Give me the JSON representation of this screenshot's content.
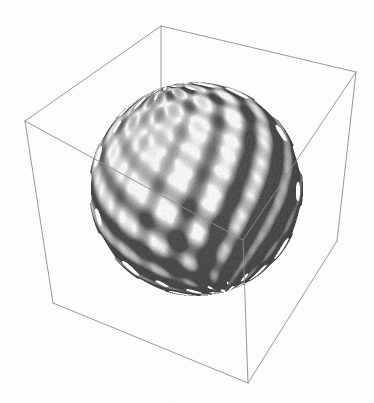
{
  "figure": {
    "kind": "3d-surface-plot",
    "background_color": "#fdfdfc",
    "width": 374,
    "height": 403
  },
  "bounding_box": {
    "name": "wireframe-cube",
    "line_color": "#8d8d8d",
    "hidden_line_color": "#a9a9a9",
    "line_width": 0.9,
    "vertices": {
      "back_top_left": [
        25,
        121
      ],
      "back_top_center": [
        161,
        26
      ],
      "back_top_right": [
        356,
        72
      ],
      "front_top_left": [
        92,
        168
      ],
      "left_bottom": [
        53,
        303
      ],
      "center_top": [
        161,
        26
      ],
      "right_bottom": [
        337,
        241
      ],
      "front_bottom": [
        248,
        383
      ],
      "front_top": [
        243,
        240
      ]
    },
    "edges": [
      {
        "name": "top-back-left",
        "from": [
          25,
          121
        ],
        "to": [
          161,
          26
        ]
      },
      {
        "name": "top-back-right",
        "from": [
          161,
          26
        ],
        "to": [
          356,
          72
        ]
      },
      {
        "name": "top-front-left",
        "from": [
          25,
          121
        ],
        "to": [
          243,
          240
        ]
      },
      {
        "name": "top-front-right",
        "from": [
          243,
          240
        ],
        "to": [
          356,
          72
        ]
      },
      {
        "name": "vertical-back",
        "from": [
          161,
          26
        ],
        "to": [
          161,
          92
        ]
      },
      {
        "name": "vertical-left",
        "from": [
          25,
          121
        ],
        "to": [
          53,
          303
        ]
      },
      {
        "name": "vertical-right",
        "from": [
          356,
          72
        ],
        "to": [
          337,
          241
        ]
      },
      {
        "name": "vertical-front",
        "from": [
          243,
          240
        ],
        "to": [
          248,
          383
        ]
      },
      {
        "name": "bottom-front-left",
        "from": [
          53,
          303
        ],
        "to": [
          248,
          383
        ]
      },
      {
        "name": "bottom-front-right",
        "from": [
          248,
          383
        ],
        "to": [
          337,
          241
        ]
      }
    ]
  },
  "surface": {
    "name": "bumpy-sphere",
    "center": [
      196,
      189
    ],
    "radius": 107,
    "bumps_longitude": 14,
    "bumps_latitude": 11,
    "bump_amplitude": 0.085,
    "tilt_degrees": -16,
    "light_direction": [
      -0.45,
      -0.62,
      0.64
    ],
    "shade_light": "#f4f4f4",
    "shade_mid": "#9a9a9a",
    "shade_dark": "#2a2a2a",
    "ambient": 0.16,
    "specular_power": 11
  },
  "chart_data": {
    "type": "surface",
    "title": "",
    "xlabel": "",
    "ylabel": "",
    "zlabel": "",
    "equation": "r(theta, phi) = 1 + a*sin(m*theta)*sin(n*phi)",
    "parameters": {
      "a": 0.085,
      "m": 14,
      "n": 11
    },
    "grid": false,
    "legend": false,
    "axis_ticks": [],
    "colormap": "grayscale"
  }
}
